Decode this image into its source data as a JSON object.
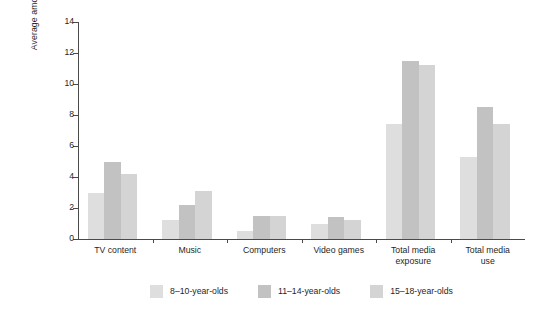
{
  "chart_data": {
    "type": "bar",
    "title": "",
    "subtitle": "",
    "xlabel": "",
    "ylabel": "Average amount of time spent with media in a typical day (hours)",
    "ylim": [
      0,
      14
    ],
    "ytick_values": [
      0,
      2,
      4,
      6,
      8,
      10,
      12,
      14
    ],
    "ytick_labels": [
      "0",
      "2",
      "4",
      "6",
      "8",
      "10",
      "12",
      "14"
    ],
    "grid": false,
    "legend_position": "bottom",
    "categories": [
      "TV content",
      "Music",
      "Computers",
      "Video games",
      "Total media exposure",
      "Total media use"
    ],
    "category_lines": [
      [
        "TV content"
      ],
      [
        "Music"
      ],
      [
        "Computers"
      ],
      [
        "Video games"
      ],
      [
        "Total media",
        "exposure"
      ],
      [
        "Total media",
        "use"
      ]
    ],
    "series": [
      {
        "name": "8–10-year-olds",
        "color": "#dedede",
        "values": [
          3.0,
          1.2,
          0.5,
          1.0,
          7.4,
          5.3
        ]
      },
      {
        "name": "11–14-year-olds",
        "color": "#c2c2c2",
        "values": [
          5.0,
          2.2,
          1.5,
          1.4,
          11.5,
          8.5
        ]
      },
      {
        "name": "15–18-year-olds",
        "color": "#d4d4d4",
        "values": [
          4.2,
          3.1,
          1.5,
          1.2,
          11.2,
          7.4
        ]
      }
    ]
  },
  "legend": {
    "items": [
      {
        "label": "8–10-year-olds",
        "color": "#dedede"
      },
      {
        "label": "11–14-year-olds",
        "color": "#c2c2c2"
      },
      {
        "label": "15–18-year-olds",
        "color": "#d4d4d4"
      }
    ]
  },
  "axis": {
    "line_color": "#4a4a4a",
    "text_color": "#1f1f1f"
  },
  "background": "#ffffff"
}
